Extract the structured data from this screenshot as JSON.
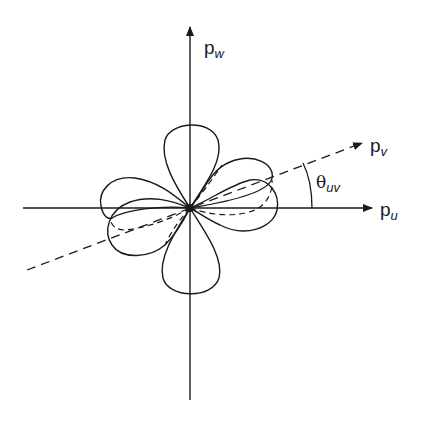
{
  "diagram": {
    "type": "polar-lobe-diagram",
    "axes": [
      {
        "id": "pu",
        "label_main": "p",
        "label_sub": "u",
        "direction": "horizontal"
      },
      {
        "id": "pw",
        "label_main": "p",
        "label_sub": "w",
        "direction": "vertical"
      },
      {
        "id": "pv",
        "label_main": "p",
        "label_sub": "v",
        "direction": "rotated",
        "style": "dashed"
      }
    ],
    "angle_label": {
      "symbol": "θ",
      "sub": "uv"
    },
    "lobes": {
      "solid": 4,
      "dashed": 2,
      "description": "Four-lobed (cloverleaf) solid curve; dashed curve rotated by θuv"
    },
    "colors": {
      "stroke": "#1a1a1a",
      "background": "#ffffff"
    }
  }
}
